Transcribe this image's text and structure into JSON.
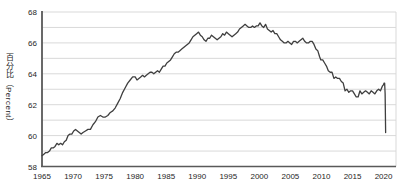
{
  "chart_data": {
    "type": "line",
    "title": "",
    "xlabel": "",
    "ylabel": "百分比（Percent）",
    "x_ticks": [
      1965,
      1970,
      1975,
      1980,
      1985,
      1990,
      1995,
      2000,
      2005,
      2010,
      2015,
      2020
    ],
    "y_ticks": [
      58,
      60,
      62,
      64,
      66,
      68
    ],
    "xlim": [
      1965,
      2022
    ],
    "ylim": [
      58,
      68
    ],
    "grid": {
      "horizontal_every": 1,
      "color": "#d9d9d9",
      "vertical": false
    },
    "plot_border_right": true,
    "axis_color": "#595959",
    "tick_label_color": "#262626",
    "background": "#ffffff",
    "series": [
      {
        "name": "labor-force-participation-rate-percent",
        "color": "#3f3f3f",
        "points": [
          [
            1965.0,
            58.7
          ],
          [
            1965.3,
            58.8
          ],
          [
            1965.6,
            58.9
          ],
          [
            1965.9,
            58.9
          ],
          [
            1966.2,
            59.0
          ],
          [
            1966.5,
            59.2
          ],
          [
            1966.8,
            59.2
          ],
          [
            1967.1,
            59.3
          ],
          [
            1967.4,
            59.5
          ],
          [
            1967.7,
            59.4
          ],
          [
            1968.0,
            59.5
          ],
          [
            1968.3,
            59.4
          ],
          [
            1968.6,
            59.6
          ],
          [
            1968.9,
            59.7
          ],
          [
            1969.2,
            60.0
          ],
          [
            1969.5,
            60.1
          ],
          [
            1969.8,
            60.1
          ],
          [
            1970.1,
            60.3
          ],
          [
            1970.4,
            60.4
          ],
          [
            1970.7,
            60.3
          ],
          [
            1971.0,
            60.2
          ],
          [
            1971.3,
            60.1
          ],
          [
            1971.6,
            60.2
          ],
          [
            1972.0,
            60.3
          ],
          [
            1972.4,
            60.4
          ],
          [
            1972.8,
            60.4
          ],
          [
            1973.2,
            60.7
          ],
          [
            1973.6,
            60.9
          ],
          [
            1974.0,
            61.2
          ],
          [
            1974.4,
            61.3
          ],
          [
            1974.8,
            61.2
          ],
          [
            1975.2,
            61.2
          ],
          [
            1975.6,
            61.3
          ],
          [
            1976.0,
            61.5
          ],
          [
            1976.4,
            61.6
          ],
          [
            1976.8,
            61.8
          ],
          [
            1977.2,
            62.1
          ],
          [
            1977.6,
            62.4
          ],
          [
            1978.0,
            62.8
          ],
          [
            1978.4,
            63.1
          ],
          [
            1978.8,
            63.4
          ],
          [
            1979.2,
            63.6
          ],
          [
            1979.6,
            63.8
          ],
          [
            1980.0,
            63.8
          ],
          [
            1980.3,
            63.6
          ],
          [
            1980.6,
            63.7
          ],
          [
            1980.9,
            63.8
          ],
          [
            1981.2,
            63.9
          ],
          [
            1981.5,
            63.8
          ],
          [
            1981.8,
            63.9
          ],
          [
            1982.1,
            64.0
          ],
          [
            1982.4,
            64.1
          ],
          [
            1982.7,
            64.1
          ],
          [
            1983.0,
            64.0
          ],
          [
            1983.3,
            64.1
          ],
          [
            1983.6,
            64.2
          ],
          [
            1983.9,
            64.1
          ],
          [
            1984.2,
            64.3
          ],
          [
            1984.5,
            64.5
          ],
          [
            1984.8,
            64.5
          ],
          [
            1985.1,
            64.7
          ],
          [
            1985.4,
            64.8
          ],
          [
            1985.7,
            64.9
          ],
          [
            1986.0,
            65.1
          ],
          [
            1986.3,
            65.3
          ],
          [
            1986.6,
            65.4
          ],
          [
            1986.9,
            65.4
          ],
          [
            1987.2,
            65.5
          ],
          [
            1987.5,
            65.6
          ],
          [
            1987.8,
            65.7
          ],
          [
            1988.1,
            65.8
          ],
          [
            1988.4,
            65.9
          ],
          [
            1988.7,
            66.0
          ],
          [
            1989.0,
            66.2
          ],
          [
            1989.3,
            66.4
          ],
          [
            1989.6,
            66.5
          ],
          [
            1989.9,
            66.6
          ],
          [
            1990.2,
            66.7
          ],
          [
            1990.5,
            66.5
          ],
          [
            1990.8,
            66.4
          ],
          [
            1991.1,
            66.2
          ],
          [
            1991.4,
            66.1
          ],
          [
            1991.7,
            66.3
          ],
          [
            1992.0,
            66.3
          ],
          [
            1992.3,
            66.5
          ],
          [
            1992.6,
            66.4
          ],
          [
            1992.9,
            66.3
          ],
          [
            1993.2,
            66.2
          ],
          [
            1993.5,
            66.3
          ],
          [
            1993.8,
            66.4
          ],
          [
            1994.1,
            66.6
          ],
          [
            1994.4,
            66.5
          ],
          [
            1994.7,
            66.7
          ],
          [
            1995.0,
            66.6
          ],
          [
            1995.3,
            66.5
          ],
          [
            1995.6,
            66.4
          ],
          [
            1995.9,
            66.5
          ],
          [
            1996.2,
            66.6
          ],
          [
            1996.5,
            66.7
          ],
          [
            1996.8,
            66.9
          ],
          [
            1997.1,
            67.0
          ],
          [
            1997.4,
            67.1
          ],
          [
            1997.7,
            67.2
          ],
          [
            1998.0,
            67.1
          ],
          [
            1998.3,
            67.0
          ],
          [
            1998.6,
            67.0
          ],
          [
            1998.9,
            67.1
          ],
          [
            1999.2,
            67.0
          ],
          [
            1999.5,
            67.1
          ],
          [
            1999.8,
            67.1
          ],
          [
            2000.1,
            67.3
          ],
          [
            2000.4,
            67.1
          ],
          [
            2000.7,
            67.0
          ],
          [
            2001.0,
            67.2
          ],
          [
            2001.3,
            66.9
          ],
          [
            2001.6,
            66.8
          ],
          [
            2001.9,
            66.7
          ],
          [
            2002.2,
            66.8
          ],
          [
            2002.5,
            66.6
          ],
          [
            2002.8,
            66.6
          ],
          [
            2003.1,
            66.4
          ],
          [
            2003.4,
            66.2
          ],
          [
            2003.7,
            66.1
          ],
          [
            2004.0,
            66.0
          ],
          [
            2004.3,
            66.0
          ],
          [
            2004.6,
            66.1
          ],
          [
            2004.9,
            66.0
          ],
          [
            2005.2,
            65.9
          ],
          [
            2005.5,
            66.1
          ],
          [
            2005.8,
            66.1
          ],
          [
            2006.1,
            66.0
          ],
          [
            2006.4,
            66.1
          ],
          [
            2006.7,
            66.2
          ],
          [
            2007.0,
            66.3
          ],
          [
            2007.3,
            66.1
          ],
          [
            2007.6,
            66.0
          ],
          [
            2007.9,
            66.0
          ],
          [
            2008.2,
            66.1
          ],
          [
            2008.5,
            66.1
          ],
          [
            2008.8,
            65.9
          ],
          [
            2009.1,
            65.6
          ],
          [
            2009.4,
            65.5
          ],
          [
            2009.7,
            65.1
          ],
          [
            2009.9,
            64.9
          ],
          [
            2010.2,
            64.9
          ],
          [
            2010.5,
            64.7
          ],
          [
            2010.8,
            64.5
          ],
          [
            2011.1,
            64.2
          ],
          [
            2011.4,
            64.1
          ],
          [
            2011.7,
            64.1
          ],
          [
            2012.0,
            63.7
          ],
          [
            2012.3,
            63.8
          ],
          [
            2012.6,
            63.7
          ],
          [
            2012.9,
            63.7
          ],
          [
            2013.2,
            63.5
          ],
          [
            2013.5,
            63.4
          ],
          [
            2013.8,
            62.9
          ],
          [
            2014.1,
            63.0
          ],
          [
            2014.4,
            62.8
          ],
          [
            2014.7,
            62.9
          ],
          [
            2015.0,
            62.9
          ],
          [
            2015.3,
            62.7
          ],
          [
            2015.6,
            62.5
          ],
          [
            2015.9,
            62.5
          ],
          [
            2016.2,
            62.9
          ],
          [
            2016.5,
            62.7
          ],
          [
            2016.8,
            62.8
          ],
          [
            2017.1,
            62.9
          ],
          [
            2017.4,
            62.8
          ],
          [
            2017.7,
            62.7
          ],
          [
            2018.0,
            62.9
          ],
          [
            2018.3,
            62.8
          ],
          [
            2018.6,
            62.7
          ],
          [
            2018.9,
            62.9
          ],
          [
            2019.2,
            63.0
          ],
          [
            2019.5,
            62.9
          ],
          [
            2019.8,
            63.2
          ],
          [
            2020.0,
            63.3
          ],
          [
            2020.08,
            63.4
          ],
          [
            2020.17,
            63.4
          ],
          [
            2020.25,
            62.7
          ],
          [
            2020.33,
            60.2
          ]
        ]
      }
    ]
  }
}
